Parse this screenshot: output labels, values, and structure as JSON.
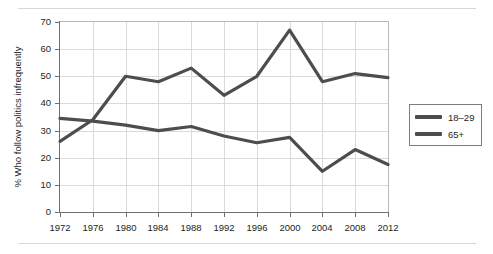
{
  "chart_data": {
    "type": "line",
    "title": "",
    "xlabel": "",
    "ylabel": "% Who follow politics infrequently",
    "x": [
      1972,
      1976,
      1980,
      1984,
      1988,
      1992,
      1996,
      2000,
      2004,
      2008,
      2012
    ],
    "xtick_labels": [
      "1972",
      "1976",
      "1980",
      "1984",
      "1988",
      "1992",
      "1996",
      "2000",
      "2004",
      "2008",
      "2012"
    ],
    "ytick_labels": [
      "0",
      "10",
      "20",
      "30",
      "40",
      "50",
      "60",
      "70"
    ],
    "ytick_values": [
      0,
      10,
      20,
      30,
      40,
      50,
      60,
      70
    ],
    "ylim": [
      0,
      70
    ],
    "grid": true,
    "legend_position": "right-outside",
    "series": [
      {
        "name": "18–29",
        "color": "#4d4d4d",
        "values": [
          26,
          34,
          50,
          48,
          53,
          43,
          50,
          67,
          48,
          51,
          49.5
        ]
      },
      {
        "name": "65+",
        "color": "#4d4d4d",
        "values": [
          34.5,
          33.5,
          32,
          30,
          31.5,
          28,
          25.5,
          27.5,
          15,
          23,
          17.5
        ]
      }
    ]
  },
  "legend": {
    "entries": [
      {
        "label": "18–29"
      },
      {
        "label": "65+"
      }
    ]
  }
}
